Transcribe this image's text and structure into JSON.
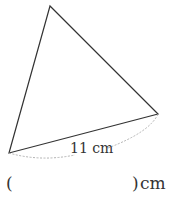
{
  "diagram": {
    "shape": "triangle",
    "vertices": {
      "top": [
        50,
        6
      ],
      "bottom_left": [
        9,
        153
      ],
      "right": [
        158,
        114
      ]
    },
    "base_label": "11 cm",
    "stroke_color": "#333333",
    "dashed_color": "#aaaaaa"
  },
  "answer": {
    "open_paren": "(",
    "close_paren": ")",
    "unit": "cm",
    "value": ""
  }
}
